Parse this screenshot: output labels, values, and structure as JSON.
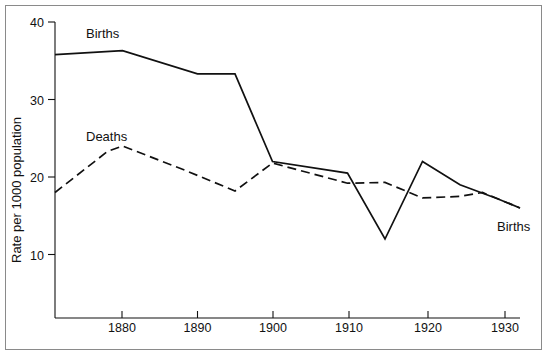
{
  "chart_data": {
    "type": "line",
    "title": "",
    "subtitle": "",
    "xlabel": "",
    "ylabel": "Rate per 1000 population",
    "xlim": [
      1871,
      1933
    ],
    "ylim": [
      4,
      40
    ],
    "xticks": [
      1880,
      1890,
      1900,
      1910,
      1920,
      1930
    ],
    "xtick_labels": [
      "1880",
      "1890",
      "1900",
      "1910",
      "1920",
      "1930"
    ],
    "yticks": [
      10,
      20,
      30,
      40
    ],
    "ytick_labels": [
      "10",
      "20",
      "30",
      "40"
    ],
    "grid": false,
    "legend_position": "inline-annotations",
    "annotations": [
      {
        "text": "Births",
        "x": 1882,
        "y": 38.3,
        "series": "Births",
        "position": "top-left"
      },
      {
        "text": "Deaths",
        "x": 1882,
        "y": 26.3,
        "series": "Deaths",
        "position": "mid-left"
      },
      {
        "text": "Births",
        "x": 1931,
        "y": 13.6,
        "series": "Births",
        "position": "bottom-right"
      }
    ],
    "series": [
      {
        "name": "Births",
        "style": "solid",
        "color": "#111111",
        "x": [
          1871,
          1880,
          1890,
          1895,
          1900,
          1910,
          1915,
          1920,
          1925,
          1930,
          1933
        ],
        "values": [
          35.8,
          36.3,
          33.3,
          33.3,
          22.0,
          20.5,
          12.0,
          22.0,
          19.0,
          17.2,
          16.0
        ]
      },
      {
        "name": "Deaths",
        "style": "dashed",
        "color": "#111111",
        "x": [
          1871,
          1878,
          1880,
          1888,
          1895,
          1900,
          1910,
          1915,
          1920,
          1925,
          1928,
          1933
        ],
        "values": [
          18.0,
          23.3,
          24.0,
          21.0,
          18.2,
          21.8,
          19.2,
          19.3,
          17.3,
          17.5,
          18.0,
          16.0
        ]
      }
    ]
  },
  "axes": {
    "y_axis_title": "Rate per 1000 population",
    "y_tick_40": "40",
    "y_tick_30": "30",
    "y_tick_20": "20",
    "y_tick_10": "10",
    "x_tick_1880": "1880",
    "x_tick_1890": "1890",
    "x_tick_1900": "1900",
    "x_tick_1910": "1910",
    "x_tick_1920": "1920",
    "x_tick_1930": "1930"
  },
  "labels": {
    "births_top": "Births",
    "deaths_mid": "Deaths",
    "births_right": "Births"
  },
  "colors": {
    "ink": "#111111",
    "frame": "#8a8a8a",
    "background": "#ffffff"
  }
}
